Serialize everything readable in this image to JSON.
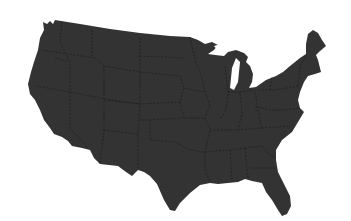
{
  "map": {
    "subject": "United States (contiguous 48 states) silhouette",
    "style": "dark gray fill with dashed state borders on white background",
    "colors": {
      "land": "#333333",
      "border": "#1e1e1e",
      "background": "#ffffff"
    }
  }
}
